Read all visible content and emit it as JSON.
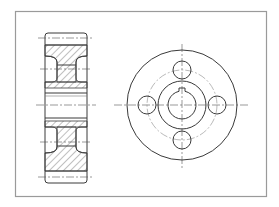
{
  "drawing": {
    "type": "mechanical-engineering-drawing",
    "subject": "flanged wheel / hub with four holes and keyed bore",
    "views": [
      {
        "name": "sectional-side-view",
        "description": "cross-section with hatched material regions"
      },
      {
        "name": "front-view",
        "description": "circular view with outer rim, pitch circle, four holes, hub and keyed bore"
      }
    ],
    "colors": {
      "background": "#ffffff",
      "frame": "#9a9a9a",
      "line": "#3a3a3a",
      "centerline": "#555555"
    },
    "front_view": {
      "center": [
        182,
        105
      ],
      "outer_radius": 55,
      "pitch_radius": 35,
      "hole_radius": 9,
      "hole_count": 4,
      "hub_radius": 24,
      "bore_radius": 14,
      "keyway": "top"
    }
  }
}
